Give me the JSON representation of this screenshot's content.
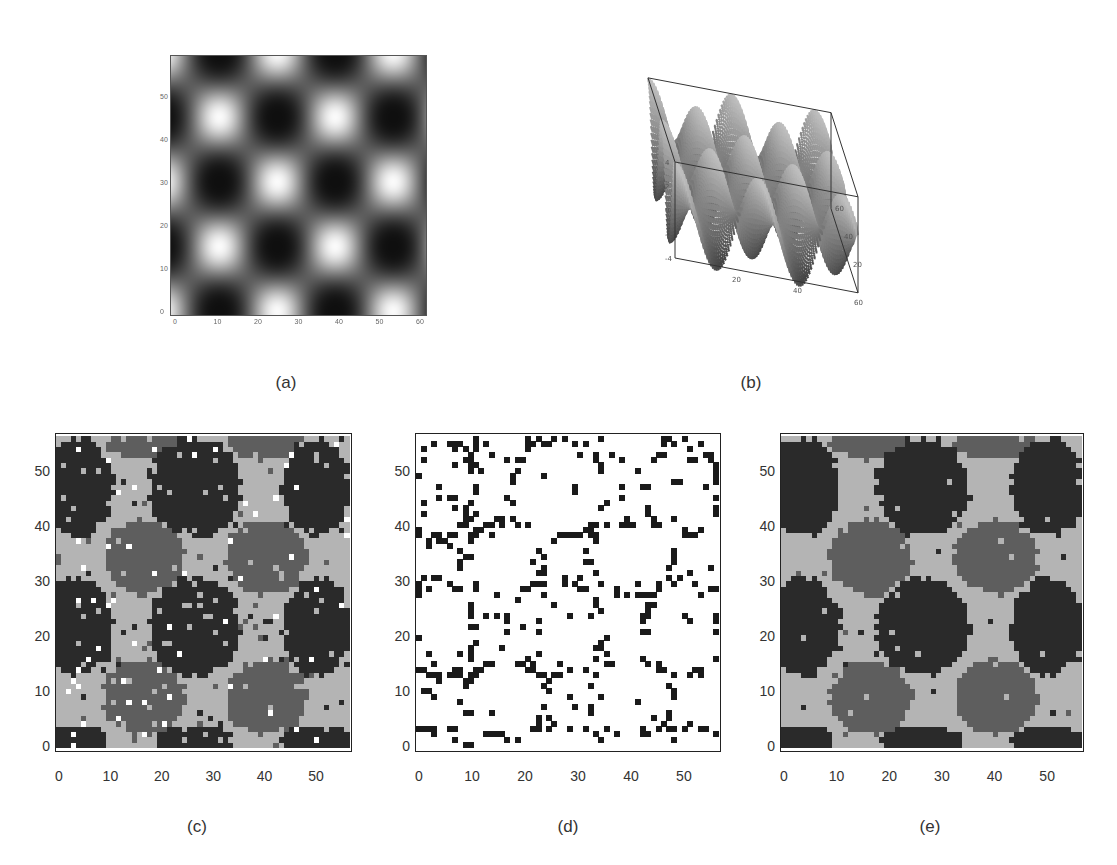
{
  "figure": {
    "panels": [
      {
        "id": "a",
        "label": "(a)",
        "kind": "density-image",
        "description": "Grayscale intensity map of a 2D periodic potential (3x2 bright peaks, dark troughs)",
        "x_ticks": [
          "0",
          "10",
          "20",
          "30",
          "40",
          "50",
          "60"
        ],
        "y_ticks": [
          "0",
          "10",
          "20",
          "30",
          "40",
          "50"
        ]
      },
      {
        "id": "b",
        "label": "(b)",
        "kind": "surface-3d",
        "description": "3D surface plot of the periodic potential",
        "z_ticks": [
          "4",
          "2",
          "0",
          "-2",
          "-4"
        ],
        "x_ticks": [
          "20",
          "40",
          "60"
        ],
        "y_ticks": [
          "20",
          "40",
          "60"
        ]
      },
      {
        "id": "c",
        "label": "(c)",
        "kind": "cluster-map",
        "x_ticks": [
          "0",
          "10",
          "20",
          "30",
          "40",
          "50"
        ],
        "y_ticks": [
          "0",
          "10",
          "20",
          "30",
          "40",
          "50"
        ]
      },
      {
        "id": "d",
        "label": "(d)",
        "kind": "binary-map",
        "x_ticks": [
          "0",
          "10",
          "20",
          "30",
          "40",
          "50"
        ],
        "y_ticks": [
          "0",
          "10",
          "20",
          "30",
          "40",
          "50"
        ]
      },
      {
        "id": "e",
        "label": "(e)",
        "kind": "cluster-map",
        "x_ticks": [
          "0",
          "10",
          "20",
          "30",
          "40",
          "50"
        ],
        "y_ticks": [
          "0",
          "10",
          "20",
          "30",
          "40",
          "50"
        ]
      }
    ],
    "caption_fragment": ""
  },
  "chart_data": [
    {
      "type": "heatmap",
      "title": "(a)",
      "xlabel": "",
      "ylabel": "",
      "xlim": [
        0,
        60
      ],
      "ylim": [
        0,
        60
      ],
      "pattern": "cos-product periodic field; bright peaks at (x,y) ≈ (10,12),(30,12),(50,12),(10,38),(30,38),(50,38); dark minima at (20,25),(40,25),(20,52),(40,52)",
      "colormap": "grayscale"
    },
    {
      "type": "surface",
      "title": "(b)",
      "xlim": [
        0,
        60
      ],
      "ylim": [
        0,
        60
      ],
      "zlim": [
        -4,
        4
      ],
      "z_ticks": [
        4,
        2,
        0,
        -2,
        -4
      ],
      "x_ticks": [
        20,
        40,
        60
      ],
      "y_ticks": [
        20,
        40,
        60
      ]
    },
    {
      "type": "heatmap",
      "title": "(c)",
      "xlim": [
        0,
        57
      ],
      "ylim": [
        0,
        57
      ],
      "x_ticks": [
        0,
        10,
        20,
        30,
        40,
        50
      ],
      "y_ticks": [
        0,
        10,
        20,
        30,
        40,
        50
      ],
      "classes": [
        {
          "name": "dark cluster",
          "color": "#2a2a2a"
        },
        {
          "name": "medium cluster",
          "color": "#5e5e5e"
        },
        {
          "name": "light background",
          "color": "#b4b4b4"
        },
        {
          "name": "noise/unassigned",
          "color": "#ffffff"
        }
      ],
      "dark_blobs": [
        [
          4,
          48,
          6,
          8
        ],
        [
          27,
          48,
          8,
          8
        ],
        [
          51,
          48,
          6,
          8
        ],
        [
          4,
          22,
          6,
          8
        ],
        [
          27,
          22,
          8,
          8
        ],
        [
          51,
          22,
          6,
          8
        ],
        [
          4,
          1,
          5,
          2
        ],
        [
          27,
          1,
          7,
          2
        ],
        [
          51,
          1,
          6,
          2
        ]
      ],
      "medium_blobs": [
        [
          17,
          35,
          7,
          6
        ],
        [
          41,
          35,
          7,
          6
        ],
        [
          17,
          9,
          7,
          6
        ],
        [
          41,
          9,
          7,
          6
        ],
        [
          17,
          56,
          7,
          2
        ],
        [
          41,
          56,
          7,
          2
        ]
      ],
      "noise_level": 0.06
    },
    {
      "type": "heatmap",
      "title": "(d)",
      "xlim": [
        0,
        57
      ],
      "ylim": [
        0,
        57
      ],
      "x_ticks": [
        0,
        10,
        20,
        30,
        40,
        50
      ],
      "y_ticks": [
        0,
        10,
        20,
        30,
        40,
        50
      ],
      "classes": [
        {
          "name": "boundary/changed",
          "color": "#1a1a1a"
        },
        {
          "name": "unchanged",
          "color": "#ffffff"
        }
      ],
      "description": "Sparse black cells concentrated along cluster boundaries of (c)/(e)"
    },
    {
      "type": "heatmap",
      "title": "(e)",
      "xlim": [
        0,
        57
      ],
      "ylim": [
        0,
        57
      ],
      "x_ticks": [
        0,
        10,
        20,
        30,
        40,
        50
      ],
      "y_ticks": [
        0,
        10,
        20,
        30,
        40,
        50
      ],
      "classes": [
        {
          "name": "dark cluster",
          "color": "#2a2a2a"
        },
        {
          "name": "medium cluster",
          "color": "#5e5e5e"
        },
        {
          "name": "light background",
          "color": "#b4b4b4"
        }
      ],
      "dark_blobs": [
        [
          4,
          48,
          6,
          8
        ],
        [
          27,
          48,
          8,
          8
        ],
        [
          51,
          48,
          6,
          8
        ],
        [
          4,
          22,
          6,
          8
        ],
        [
          27,
          22,
          8,
          8
        ],
        [
          51,
          22,
          6,
          8
        ],
        [
          4,
          1,
          5,
          2
        ],
        [
          27,
          1,
          7,
          2
        ],
        [
          51,
          1,
          6,
          2
        ]
      ],
      "medium_blobs": [
        [
          17,
          35,
          7,
          6
        ],
        [
          41,
          35,
          7,
          6
        ],
        [
          17,
          9,
          7,
          6
        ],
        [
          41,
          9,
          7,
          6
        ],
        [
          17,
          56,
          7,
          2
        ],
        [
          41,
          56,
          7,
          2
        ]
      ],
      "noise_level": 0.015
    }
  ]
}
